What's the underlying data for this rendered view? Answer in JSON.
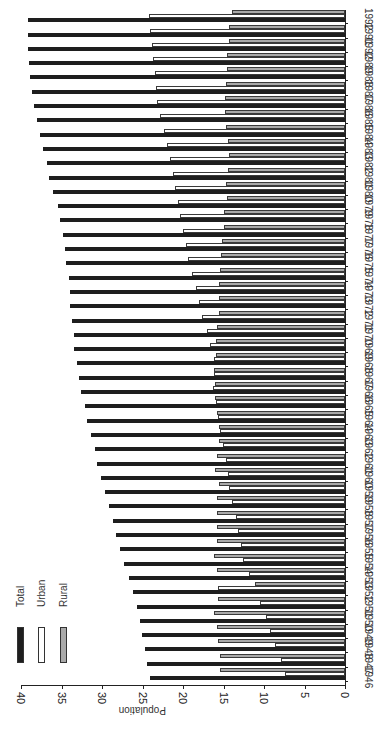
{
  "chart_data": {
    "type": "bar",
    "orientation": "rotated 90° (years along vertical, population along horizontal)",
    "title": "",
    "xlabel": "",
    "ylabel": "Population",
    "ylim": [
      0,
      40
    ],
    "yticks": [
      0,
      5,
      10,
      15,
      20,
      25,
      30,
      35,
      40
    ],
    "grid": false,
    "legend_position": "lower-left (upper-left when upright)",
    "categories": [
      "1946",
      "1947",
      "1948",
      "1949",
      "1950",
      "1951",
      "1952",
      "1953",
      "1954",
      "1955",
      "1956",
      "1957",
      "1958",
      "1959",
      "1960",
      "1961",
      "1962",
      "1963",
      "1964",
      "1965",
      "1966",
      "1967",
      "1968",
      "1969",
      "1970",
      "1971",
      "1972",
      "1973",
      "1974",
      "1975",
      "1976",
      "1977",
      "1978",
      "1979",
      "1980",
      "1981",
      "1982",
      "1983",
      "1984",
      "1985",
      "1986",
      "1987",
      "1988",
      "1989",
      "1990",
      "1991",
      "1992"
    ],
    "category_labels_shown": [
      "1946",
      "1947",
      "1948",
      "1949",
      "1950",
      "1951",
      "1952",
      "1953",
      "1954",
      "1955",
      "1956",
      "1957",
      "1958",
      "1959",
      "1960",
      "1961",
      "1962",
      "1963",
      "1964",
      "1965",
      "1966",
      "1967",
      "1968",
      "1969",
      "1970",
      "1971",
      "1972",
      "1973",
      "1974",
      "1975",
      "1976",
      "1977",
      "1978",
      "1979",
      "1980",
      "1981",
      "1982",
      "1983",
      "1984",
      "1985",
      "1986",
      "1987",
      "1988",
      "1989",
      "1992",
      "1991",
      "1992"
    ],
    "series": [
      {
        "name": "Total",
        "color": "#1e1e1e",
        "values": [
          24.1,
          24.4,
          24.7,
          25.1,
          25.3,
          25.7,
          26.2,
          26.7,
          27.3,
          27.8,
          28.3,
          28.6,
          29.1,
          29.6,
          30.1,
          30.6,
          30.9,
          31.4,
          31.9,
          32.1,
          32.6,
          32.9,
          33.1,
          33.4,
          33.5,
          33.7,
          33.9,
          34.0,
          34.1,
          34.4,
          34.6,
          34.8,
          35.2,
          35.4,
          36.0,
          36.5,
          36.8,
          37.3,
          37.7,
          38.0,
          38.4,
          38.6,
          38.9,
          39.0,
          39.1,
          39.1,
          39.1
        ]
      },
      {
        "name": "Urban",
        "color": "#ffffff",
        "values": [
          7.4,
          7.9,
          8.6,
          9.3,
          9.8,
          10.5,
          15.7,
          11.8,
          12.6,
          12.8,
          13.2,
          13.5,
          13.9,
          14.3,
          14.4,
          14.7,
          15.1,
          15.4,
          15.7,
          15.9,
          16.3,
          16.2,
          16.2,
          16.7,
          17.0,
          17.7,
          18.0,
          18.4,
          18.9,
          19.4,
          19.6,
          20.0,
          20.4,
          20.6,
          21.0,
          21.2,
          21.6,
          22.0,
          22.3,
          22.8,
          23.2,
          23.3,
          23.5,
          23.7,
          23.8,
          24.1,
          24.2
        ]
      },
      {
        "name": "Rural",
        "color": "#a9a9a9",
        "values": [
          15.4,
          15.4,
          15.7,
          15.8,
          16.2,
          15.7,
          11.1,
          15.8,
          16.2,
          15.8,
          15.8,
          15.8,
          15.8,
          15.6,
          16.0,
          15.8,
          15.5,
          15.6,
          15.8,
          16.0,
          16.0,
          16.2,
          15.9,
          15.9,
          15.8,
          15.6,
          15.6,
          15.6,
          15.4,
          15.3,
          15.2,
          14.9,
          14.9,
          14.6,
          14.7,
          14.4,
          14.3,
          14.4,
          14.7,
          14.8,
          14.8,
          14.7,
          14.6,
          14.6,
          14.3,
          14.3,
          14.0
        ]
      }
    ]
  },
  "legend": {
    "items": [
      {
        "label": "Total",
        "color": "#1e1e1e"
      },
      {
        "label": "Urban",
        "color": "#ffffff"
      },
      {
        "label": "Rural",
        "color": "#a9a9a9"
      }
    ]
  },
  "axis": {
    "label": "Population",
    "ticks": [
      "40",
      "35",
      "30",
      "25",
      "20",
      "15",
      "10",
      "5",
      "0"
    ]
  }
}
